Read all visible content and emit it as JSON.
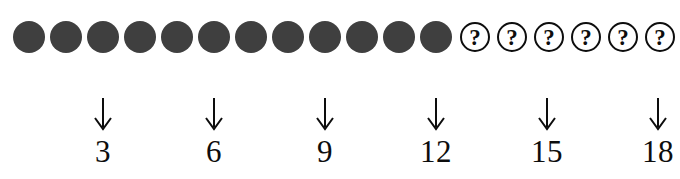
{
  "figure": {
    "background_color": "#ffffff",
    "filled_dot_color": "#3f3f3f",
    "outline_color": "#0d0d0d",
    "question_glyph": "?",
    "arrow_glyph": "down-arrow"
  },
  "sequence": {
    "total_positions": 18,
    "filled_count": 12,
    "unknown_count": 6,
    "items": [
      {
        "index": 1,
        "state": "filled"
      },
      {
        "index": 2,
        "state": "filled"
      },
      {
        "index": 3,
        "state": "filled"
      },
      {
        "index": 4,
        "state": "filled"
      },
      {
        "index": 5,
        "state": "filled"
      },
      {
        "index": 6,
        "state": "filled"
      },
      {
        "index": 7,
        "state": "filled"
      },
      {
        "index": 8,
        "state": "filled"
      },
      {
        "index": 9,
        "state": "filled"
      },
      {
        "index": 10,
        "state": "filled"
      },
      {
        "index": 11,
        "state": "filled"
      },
      {
        "index": 12,
        "state": "filled"
      },
      {
        "index": 13,
        "state": "unknown",
        "symbol": "?"
      },
      {
        "index": 14,
        "state": "unknown",
        "symbol": "?"
      },
      {
        "index": 15,
        "state": "unknown",
        "symbol": "?"
      },
      {
        "index": 16,
        "state": "unknown",
        "symbol": "?"
      },
      {
        "index": 17,
        "state": "unknown",
        "symbol": "?"
      },
      {
        "index": 18,
        "state": "unknown",
        "symbol": "?"
      }
    ]
  },
  "markers": [
    {
      "label": "3",
      "position_index": 3
    },
    {
      "label": "6",
      "position_index": 6
    },
    {
      "label": "9",
      "position_index": 9
    },
    {
      "label": "12",
      "position_index": 12
    },
    {
      "label": "15",
      "position_index": 15
    },
    {
      "label": "18",
      "position_index": 18
    }
  ]
}
